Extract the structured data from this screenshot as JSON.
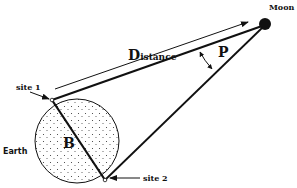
{
  "labels": {
    "moon": "Moon",
    "distance_cap": "D",
    "distance_rest": "istance",
    "parallax": "P",
    "site1": "site  1",
    "site2": "site  2",
    "earth": "Earth",
    "baseline": "B"
  },
  "colors": {
    "ink": "#111111",
    "background": "#ffffff"
  },
  "geometry": {
    "moon": {
      "cx": 265,
      "cy": 24,
      "r": 6
    },
    "earth": {
      "cx": 77,
      "cy": 141,
      "r": 42
    },
    "site1": {
      "x": 52,
      "y": 100
    },
    "site2": {
      "x": 105,
      "y": 180
    }
  }
}
